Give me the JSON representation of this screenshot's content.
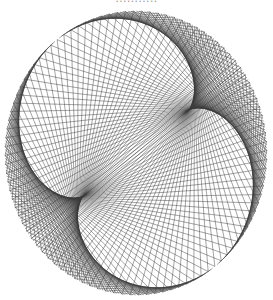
{
  "caption_fragment": "...........",
  "figure": {
    "kind": "modular-multiplication chord diagram (nephroid envelope)",
    "canvas": {
      "width": 273,
      "height": 300,
      "background": "#ffffff"
    },
    "center": {
      "x": 136,
      "y": 153
    },
    "radius": {
      "x": 131,
      "y": 142
    },
    "points": 150,
    "multiplier": 3,
    "rotation_deg": 233,
    "stroke": "#3a3a3a",
    "stroke_width": 0.55,
    "stroke_opacity": 0.85
  }
}
